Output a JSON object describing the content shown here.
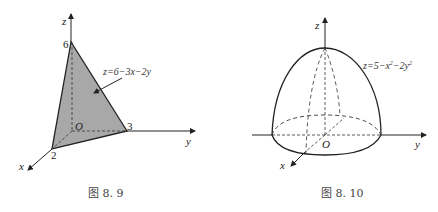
{
  "figures": [
    {
      "id": "fig-8-9",
      "caption": "图 8. 9",
      "equation": "z=6−3x−2y",
      "axes": {
        "x": "x",
        "y": "y",
        "z": "z"
      },
      "origin": "O",
      "intercepts": {
        "x": "2",
        "y": "3",
        "z": "6"
      },
      "fill_color": "#a8a8a8"
    },
    {
      "id": "fig-8-10",
      "caption": "图 8. 10",
      "equation_base": "z=5−x",
      "equation_sup1": "2",
      "equation_mid": "−2y",
      "equation_sup2": "2",
      "axes": {
        "x": "x",
        "y": "y",
        "z": "z"
      },
      "origin": "O"
    }
  ]
}
